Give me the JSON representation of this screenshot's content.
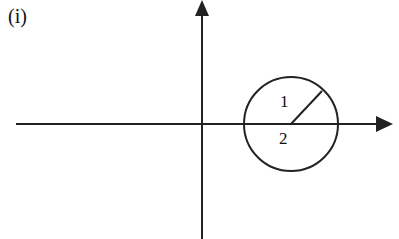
{
  "diagram": {
    "panel_label": "(i)",
    "axes": {
      "origin": [
        202,
        124
      ],
      "x_axis": {
        "from": [
          16,
          124
        ],
        "to": [
          392,
          124
        ],
        "arrow": "right"
      },
      "y_axis": {
        "from": [
          202,
          239
        ],
        "to": [
          202,
          0
        ],
        "arrow": "up"
      }
    },
    "circle": {
      "center": [
        291,
        124
      ],
      "radius": 47,
      "stroke": "#222"
    },
    "radius_line": {
      "from": [
        291,
        124
      ],
      "to": [
        322,
        91
      ]
    },
    "labels": {
      "region_1": "1",
      "region_2": "2"
    },
    "colors": {
      "ink": "#222222",
      "background": "#ffffff"
    }
  }
}
